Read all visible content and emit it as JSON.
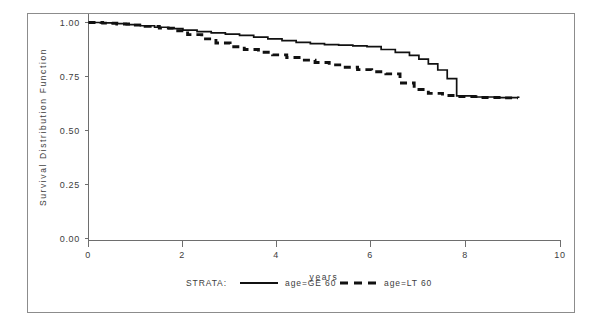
{
  "chart_data": {
    "type": "line",
    "title": "",
    "xlabel": "years",
    "ylabel": "Survival Distribution Function",
    "xlim": [
      0,
      10
    ],
    "ylim": [
      0.0,
      1.0
    ],
    "xticks": [
      "0",
      "2",
      "4",
      "6",
      "8",
      "10"
    ],
    "xtick_values": [
      0,
      2,
      4,
      6,
      8,
      10
    ],
    "yticks": [
      "0.00",
      "0.25",
      "0.50",
      "0.75",
      "1.00"
    ],
    "ytick_values": [
      0.0,
      0.25,
      0.5,
      0.75,
      1.0
    ],
    "grid": false,
    "step": true,
    "legend_position": "bottom",
    "legend_title": "STRATA:",
    "series": [
      {
        "name": "age=GE 60",
        "style": "solid",
        "points": [
          [
            0.0,
            1.0
          ],
          [
            0.25,
            0.998
          ],
          [
            0.5,
            0.995
          ],
          [
            0.8,
            0.99
          ],
          [
            1.1,
            0.985
          ],
          [
            1.4,
            0.978
          ],
          [
            1.7,
            0.972
          ],
          [
            2.0,
            0.965
          ],
          [
            2.3,
            0.958
          ],
          [
            2.6,
            0.952
          ],
          [
            2.9,
            0.946
          ],
          [
            3.2,
            0.94
          ],
          [
            3.5,
            0.932
          ],
          [
            3.8,
            0.924
          ],
          [
            4.1,
            0.916
          ],
          [
            4.4,
            0.908
          ],
          [
            4.7,
            0.902
          ],
          [
            5.0,
            0.898
          ],
          [
            5.3,
            0.895
          ],
          [
            5.6,
            0.892
          ],
          [
            5.9,
            0.888
          ],
          [
            6.2,
            0.875
          ],
          [
            6.5,
            0.862
          ],
          [
            6.8,
            0.848
          ],
          [
            7.0,
            0.83
          ],
          [
            7.2,
            0.808
          ],
          [
            7.4,
            0.78
          ],
          [
            7.6,
            0.74
          ],
          [
            7.8,
            0.66
          ],
          [
            8.2,
            0.655
          ],
          [
            8.6,
            0.652
          ],
          [
            9.1,
            0.65
          ]
        ]
      },
      {
        "name": "age=LT 60",
        "style": "dashed",
        "points": [
          [
            0.0,
            1.0
          ],
          [
            0.3,
            0.997
          ],
          [
            0.6,
            0.993
          ],
          [
            0.9,
            0.988
          ],
          [
            1.2,
            0.982
          ],
          [
            1.5,
            0.974
          ],
          [
            1.8,
            0.962
          ],
          [
            2.1,
            0.944
          ],
          [
            2.4,
            0.924
          ],
          [
            2.7,
            0.905
          ],
          [
            3.0,
            0.888
          ],
          [
            3.3,
            0.875
          ],
          [
            3.6,
            0.862
          ],
          [
            3.9,
            0.85
          ],
          [
            4.2,
            0.838
          ],
          [
            4.5,
            0.826
          ],
          [
            4.8,
            0.815
          ],
          [
            5.1,
            0.804
          ],
          [
            5.4,
            0.793
          ],
          [
            5.7,
            0.782
          ],
          [
            6.0,
            0.772
          ],
          [
            6.3,
            0.762
          ],
          [
            6.6,
            0.72
          ],
          [
            6.9,
            0.69
          ],
          [
            7.2,
            0.672
          ],
          [
            7.5,
            0.662
          ],
          [
            7.8,
            0.657
          ],
          [
            8.3,
            0.653
          ],
          [
            8.8,
            0.651
          ],
          [
            9.1,
            0.65
          ]
        ]
      }
    ]
  },
  "axes": {
    "y_title": "Survival Distribution Function",
    "x_title": "years"
  },
  "legend": {
    "title": "STRATA:",
    "entries": [
      {
        "label": "age=GE 60",
        "style": "solid"
      },
      {
        "label": "age=LT 60",
        "style": "dashed"
      }
    ]
  },
  "colors": {
    "curve": "#111111",
    "axis": "#6e6e6e",
    "text": "#3d3d3d",
    "frame": "#8c8c8c",
    "background": "#ffffff"
  }
}
